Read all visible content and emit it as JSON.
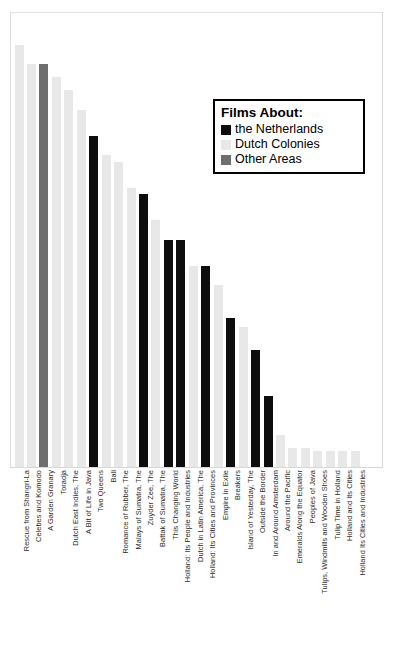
{
  "chart_data": {
    "type": "bar",
    "title": "",
    "xlabel": "",
    "ylabel": "",
    "grid": false,
    "ylim": [
      0,
      14
    ],
    "legend_position": "upper right",
    "legend_title": "Films About:",
    "series_colors": {
      "the Netherlands": "#0d0d0d",
      "Dutch Colonies": "#e8e8e8",
      "Other Areas": "#6e6e6e"
    },
    "categories": [
      "Rescue from Shangri-La",
      "Celebes and Komodo",
      "A Garden Granary",
      "Toradja",
      "Dutch East Indies, The",
      "A Bit of Life in Java",
      "Two Queens",
      "Bali",
      "Romance of Rubber, The",
      "Malays of Sumatra, The",
      "Zuyder Zee, The",
      "Battak of Sumatra, The",
      "This Changing World",
      "Holland: Its People and Industries",
      "Dutch in Latin America, The",
      "Holland: Its Cities and Provinces",
      "Empire in Exile",
      "Breakers",
      "Island of Yesterday, The",
      "Outside the Border",
      "In and Around Amsterdam",
      "Around the Pacific",
      "Emeralds Along the Equator",
      "Peoples of Java",
      "Tulips, Windmills and Wooden Shoes",
      "Tulip Time in Holland",
      "Holland and Its Cities",
      "Holland Its Cities and Industries"
    ],
    "values": [
      13.0,
      12.4,
      12.4,
      12.0,
      11.6,
      11.0,
      10.2,
      9.6,
      9.4,
      8.6,
      8.4,
      7.6,
      7.0,
      7.0,
      6.2,
      6.2,
      5.6,
      4.6,
      4.3,
      3.6,
      2.2,
      1.0,
      0.6,
      0.6,
      0.5,
      0.5,
      0.5,
      0.5
    ],
    "groups": [
      "Dutch Colonies",
      "Dutch Colonies",
      "Other Areas",
      "Dutch Colonies",
      "Dutch Colonies",
      "Dutch Colonies",
      "the Netherlands",
      "Dutch Colonies",
      "Dutch Colonies",
      "Dutch Colonies",
      "the Netherlands",
      "Dutch Colonies",
      "the Netherlands",
      "the Netherlands",
      "Dutch Colonies",
      "the Netherlands",
      "Dutch Colonies",
      "the Netherlands",
      "Dutch Colonies",
      "the Netherlands",
      "the Netherlands",
      "Dutch Colonies",
      "Dutch Colonies",
      "Dutch Colonies",
      "Dutch Colonies",
      "Dutch Colonies",
      "Dutch Colonies",
      "Dutch Colonies"
    ]
  },
  "legend": {
    "title": "Films About:",
    "entries": [
      {
        "label": "the Netherlands",
        "color": "#0d0d0d"
      },
      {
        "label": "Dutch Colonies",
        "color": "#e8e8e8"
      },
      {
        "label": "Other Areas",
        "color": "#6e6e6e"
      }
    ]
  }
}
